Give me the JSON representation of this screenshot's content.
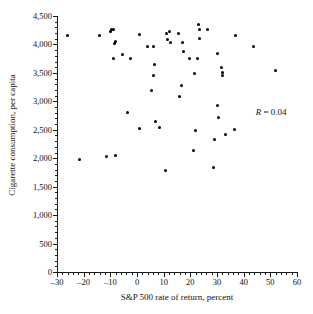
{
  "chart_data": {
    "type": "scatter",
    "title": "",
    "xlabel": "S&P 500 rate of return, percent",
    "ylabel": "Cigarette consumption, per capita",
    "xlim": [
      -30,
      60
    ],
    "ylim": [
      0,
      4500
    ],
    "xticks": [
      -30,
      -20,
      -10,
      0,
      10,
      20,
      30,
      40,
      50,
      60
    ],
    "xtick_labels": [
      "–30",
      "–20",
      "–10",
      "0",
      "10",
      "20",
      "30",
      "40",
      "50",
      "60"
    ],
    "yticks": [
      0,
      500,
      1000,
      1500,
      2000,
      2500,
      3000,
      3500,
      4000,
      4500
    ],
    "ytick_labels": [
      "0",
      "500",
      "1,000",
      "1,500",
      "2,000",
      "2,500",
      "3,000",
      "3,500",
      "4,000",
      "4,500"
    ],
    "x_minor_tick_step": 2,
    "y_minor_tick_step": 100,
    "grid": false,
    "legend": false,
    "marker": "filled-circle",
    "marker_color": "#000000",
    "annotations": [
      {
        "name": "correlation",
        "symbol": "R",
        "text": "R = 0.04",
        "value": 0.04,
        "x": 44.5,
        "y": 2900
      }
    ],
    "points": [
      {
        "x": -26.0,
        "y": 4150
      },
      {
        "x": -21.5,
        "y": 1980
      },
      {
        "x": -14.0,
        "y": 4150
      },
      {
        "x": -11.5,
        "y": 2030
      },
      {
        "x": -10.0,
        "y": 4230
      },
      {
        "x": -9.5,
        "y": 4270
      },
      {
        "x": -9.0,
        "y": 4270
      },
      {
        "x": -9.0,
        "y": 3750
      },
      {
        "x": -8.5,
        "y": 4020
      },
      {
        "x": -8.0,
        "y": 4060
      },
      {
        "x": -8.0,
        "y": 2050
      },
      {
        "x": -5.5,
        "y": 3830
      },
      {
        "x": -3.5,
        "y": 2810
      },
      {
        "x": -2.5,
        "y": 3760
      },
      {
        "x": 1.0,
        "y": 4170
      },
      {
        "x": 1.0,
        "y": 2520
      },
      {
        "x": 4.0,
        "y": 3960
      },
      {
        "x": 5.5,
        "y": 3190
      },
      {
        "x": 6.0,
        "y": 3460
      },
      {
        "x": 6.0,
        "y": 3960
      },
      {
        "x": 6.5,
        "y": 3650
      },
      {
        "x": 7.0,
        "y": 2640
      },
      {
        "x": 8.5,
        "y": 2540
      },
      {
        "x": 10.5,
        "y": 1790
      },
      {
        "x": 11.0,
        "y": 4190
      },
      {
        "x": 11.5,
        "y": 4080
      },
      {
        "x": 12.0,
        "y": 4230
      },
      {
        "x": 12.5,
        "y": 4040
      },
      {
        "x": 15.5,
        "y": 4200
      },
      {
        "x": 16.0,
        "y": 3080
      },
      {
        "x": 16.5,
        "y": 3270
      },
      {
        "x": 17.0,
        "y": 4040
      },
      {
        "x": 17.5,
        "y": 3870
      },
      {
        "x": 19.5,
        "y": 3750
      },
      {
        "x": 21.0,
        "y": 2140
      },
      {
        "x": 21.5,
        "y": 3490
      },
      {
        "x": 22.0,
        "y": 2480
      },
      {
        "x": 22.5,
        "y": 3750
      },
      {
        "x": 23.0,
        "y": 4350
      },
      {
        "x": 23.5,
        "y": 4270
      },
      {
        "x": 23.5,
        "y": 4110
      },
      {
        "x": 26.5,
        "y": 4270
      },
      {
        "x": 28.5,
        "y": 1840
      },
      {
        "x": 29.0,
        "y": 2330
      },
      {
        "x": 30.0,
        "y": 2920
      },
      {
        "x": 30.0,
        "y": 3840
      },
      {
        "x": 30.5,
        "y": 2720
      },
      {
        "x": 31.5,
        "y": 3590
      },
      {
        "x": 32.0,
        "y": 3510
      },
      {
        "x": 32.0,
        "y": 3460
      },
      {
        "x": 33.0,
        "y": 2420
      },
      {
        "x": 36.5,
        "y": 2510
      },
      {
        "x": 37.0,
        "y": 4150
      },
      {
        "x": 43.5,
        "y": 3960
      },
      {
        "x": 52.0,
        "y": 3550
      }
    ]
  }
}
